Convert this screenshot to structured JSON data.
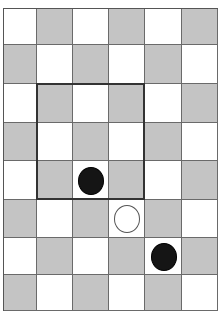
{
  "board": {
    "columns": 6,
    "rows": 8,
    "colors": {
      "light": "#ffffff",
      "dark": "#c4c4c4",
      "grid": "#6a6a6a"
    },
    "pattern": "checkerboard, top-left cell light",
    "pieces": [
      {
        "row": 4,
        "col": 2,
        "color": "black"
      },
      {
        "row": 5,
        "col": 3,
        "color": "white"
      },
      {
        "row": 6,
        "col": 4,
        "color": "black"
      }
    ],
    "highlight_region": {
      "row_start": 2,
      "col_start": 1,
      "rows": 3,
      "cols": 3
    }
  }
}
